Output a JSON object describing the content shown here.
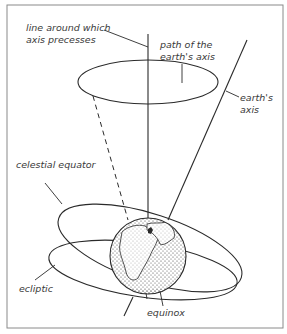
{
  "figure": {
    "type": "diagram",
    "labels": {
      "precession_line": [
        "line around which",
        "axis precesses"
      ],
      "axis_path": [
        "path of the",
        "earth's axis"
      ],
      "earth_axis": [
        "earth's",
        "axis"
      ],
      "celestial_equator": "celestial equator",
      "ecliptic": "ecliptic",
      "equinox": "equinox"
    },
    "colors": {
      "line": "#2a2a2a",
      "text": "#3a3a3a",
      "background": "#ffffff",
      "frame": "#8a8a8a"
    }
  }
}
